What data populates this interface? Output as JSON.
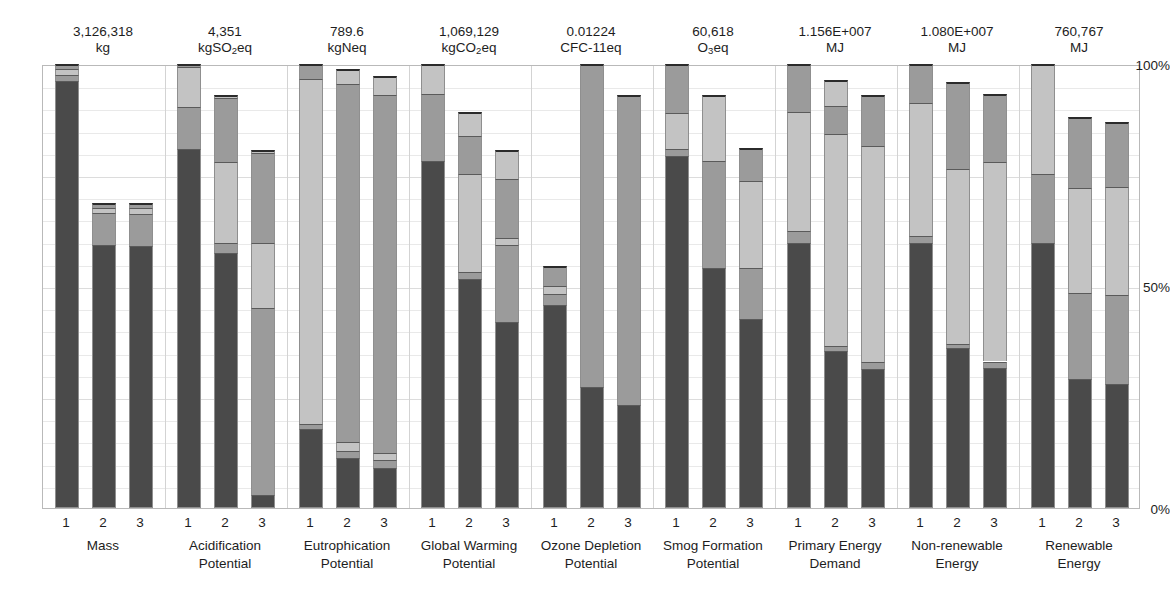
{
  "chart_data": {
    "type": "bar",
    "subtype": "stacked-percentage-bar",
    "title": "",
    "xlabel": "",
    "ylabel": "",
    "ylim": [
      0,
      100
    ],
    "ytick_labels": [
      "100%",
      "50%",
      "0%"
    ],
    "ytick_values": [
      100,
      50,
      0
    ],
    "gridlines": true,
    "legend": "none",
    "series_note": "Each bar is a stacked composition of life-cycle stage contributions, normalized so the largest scenario equals the reference value shown above each group.",
    "scenarios": [
      "1",
      "2",
      "3"
    ],
    "colors": {
      "dark": "#4a4a4a",
      "mid": "#9b9b9b",
      "light": "#c3c3c3",
      "cap": "#2b2b2b",
      "grid": "#e9e9e9",
      "frame": "#b9b9b9"
    },
    "groups": [
      {
        "name": "Mass",
        "label_line1": "Mass",
        "label_line2": "",
        "value": "3,126,318",
        "unit": "kg",
        "unit_html": "kg",
        "bars": [
          {
            "scenario": "1",
            "total": 100.0,
            "segments": [
              96.2,
              1.4,
              1.2,
              1.2
            ]
          },
          {
            "scenario": "2",
            "total": 68.6,
            "segments": [
              59.2,
              7.2,
              1.1,
              1.1
            ]
          },
          {
            "scenario": "3",
            "total": 68.6,
            "segments": [
              58.9,
              7.4,
              1.2,
              1.1
            ]
          }
        ]
      },
      {
        "name": "Acidification Potential",
        "label_line1": "Acidification",
        "label_line2": "Potential",
        "value": "4,351",
        "unit": "kgSO2eq",
        "unit_html": "kgSO<sub>2</sub>eq",
        "bars": [
          {
            "scenario": "1",
            "total": 100.0,
            "segments": [
              80.8,
              9.5,
              9.0,
              0.7
            ]
          },
          {
            "scenario": "2",
            "total": 93.0,
            "segments": [
              57.4,
              2.2,
              18.3,
              14.4,
              0.7
            ]
          },
          {
            "scenario": "3",
            "total": 80.6,
            "segments": [
              3.0,
              42.0,
              14.6,
              20.3,
              0.7
            ]
          }
        ]
      },
      {
        "name": "Eutrophication Potential",
        "label_line1": "Eutrophication",
        "label_line2": "Potential",
        "value": "789.6",
        "unit": "kgNeq",
        "unit_html": "kgNeq",
        "bars": [
          {
            "scenario": "1",
            "total": 100.0,
            "segments": [
              17.7,
              1.3,
              77.6,
              3.4
            ]
          },
          {
            "scenario": "2",
            "total": 98.8,
            "segments": [
              11.2,
              1.6,
              2.1,
              80.5,
              3.4
            ]
          },
          {
            "scenario": "3",
            "total": 97.2,
            "segments": [
              9.0,
              1.8,
              1.6,
              80.6,
              4.2
            ]
          }
        ]
      },
      {
        "name": "Global Warming Potential",
        "label_line1": "Global Warming",
        "label_line2": "Potential",
        "value": "1,069,129",
        "unit": "kgCO2eq",
        "unit_html": "kgCO<sub>2</sub>eq",
        "bars": [
          {
            "scenario": "1",
            "total": 100.0,
            "segments": [
              78.2,
              15.0,
              6.8
            ]
          },
          {
            "scenario": "2",
            "total": 89.2,
            "segments": [
              51.6,
              1.6,
              22.0,
              8.6,
              5.4
            ]
          },
          {
            "scenario": "3",
            "total": 80.6,
            "segments": [
              42.0,
              17.2,
              1.7,
              13.2,
              6.5
            ]
          }
        ]
      },
      {
        "name": "Ozone Depletion Potential",
        "label_line1": "Ozone Depletion",
        "label_line2": "Potential",
        "value": "0.01224",
        "unit": "CFC-11eq",
        "unit_html": "CFC-11eq",
        "bars": [
          {
            "scenario": "1",
            "total": 54.6,
            "segments": [
              45.8,
              2.3,
              1.8,
              4.7
            ]
          },
          {
            "scenario": "2",
            "total": 100.0,
            "segments": [
              27.3,
              72.7
            ]
          },
          {
            "scenario": "3",
            "total": 93.0,
            "segments": [
              23.2,
              69.8
            ]
          }
        ]
      },
      {
        "name": "Smog Formation Potential",
        "label_line1": "Smog Formation",
        "label_line2": "Potential",
        "value": "60,618",
        "unit": "O3eq",
        "unit_html": "O<sub>3</sub>eq",
        "bars": [
          {
            "scenario": "1",
            "total": 100.0,
            "segments": [
              79.2,
              1.6,
              8.2,
              11.0
            ]
          },
          {
            "scenario": "2",
            "total": 93.0,
            "segments": [
              54.0,
              24.2,
              14.8
            ]
          },
          {
            "scenario": "3",
            "total": 81.0,
            "segments": [
              42.6,
              11.4,
              19.6,
              7.4
            ]
          }
        ]
      },
      {
        "name": "Primary Energy Demand",
        "label_line1": "Primary Energy",
        "label_line2": "Demand",
        "value": "1.156E+007",
        "unit": "MJ",
        "unit_html": "MJ",
        "bars": [
          {
            "scenario": "1",
            "total": 100.0,
            "segments": [
              59.8,
              2.6,
              26.8,
              10.8
            ]
          },
          {
            "scenario": "2",
            "total": 96.4,
            "segments": [
              35.4,
              1.2,
              47.6,
              6.4,
              5.8
            ]
          },
          {
            "scenario": "3",
            "total": 93.0,
            "segments": [
              31.4,
              1.5,
              48.6,
              11.5
            ]
          }
        ]
      },
      {
        "name": "Non-renewable Energy",
        "label_line1": "Non-renewable",
        "label_line2": "Energy",
        "value": "1.080E+007",
        "unit": "MJ",
        "unit_html": "MJ",
        "bars": [
          {
            "scenario": "1",
            "total": 100.0,
            "segments": [
              59.8,
              1.5,
              30.0,
              8.7
            ]
          },
          {
            "scenario": "2",
            "total": 96.0,
            "segments": [
              36.0,
              0.9,
              39.4,
              19.7
            ]
          },
          {
            "scenario": "3",
            "total": 93.2,
            "segments": [
              31.6,
              1.4,
              45.0,
              15.2
            ]
          }
        ]
      },
      {
        "name": "Renewable Energy",
        "label_line1": "Renewable",
        "label_line2": "Energy",
        "value": "760,767",
        "unit": "MJ",
        "unit_html": "MJ",
        "bars": [
          {
            "scenario": "1",
            "total": 100.0,
            "segments": [
              59.6,
              15.6,
              24.8
            ]
          },
          {
            "scenario": "2",
            "total": 88.0,
            "segments": [
              29.0,
              19.4,
              23.6,
              16.0
            ]
          },
          {
            "scenario": "3",
            "total": 87.0,
            "segments": [
              28.0,
              20.0,
              24.2,
              14.8
            ]
          }
        ]
      }
    ]
  }
}
